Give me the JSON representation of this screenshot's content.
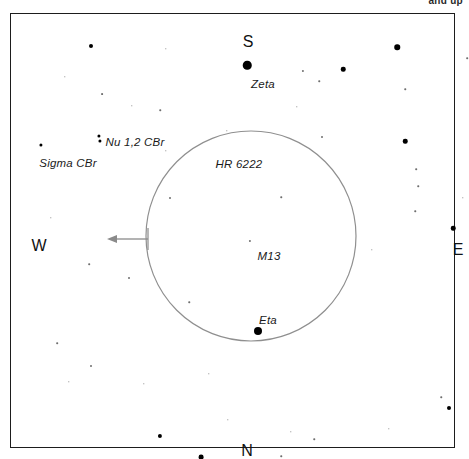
{
  "legend": {
    "caption": "and up"
  },
  "frame": {
    "name": "sky-chart-frame"
  },
  "directions": [
    {
      "id": "south",
      "label": "S",
      "x": 237,
      "y": 28
    },
    {
      "id": "west",
      "label": "W",
      "x": 28,
      "y": 232
    },
    {
      "id": "east",
      "label": "E",
      "x": 447,
      "y": 236
    },
    {
      "id": "north",
      "label": "N",
      "x": 236,
      "y": 437
    }
  ],
  "fov_circle": {
    "name": "telescope-field-of-view",
    "cx": 240,
    "cy": 222,
    "r": 105,
    "stroke": "#8f8f8f"
  },
  "direction_arrow": {
    "name": "drift-direction-arrow",
    "x1": 137,
    "y1": 225,
    "x2": 96,
    "y2": 225,
    "stroke": "#8a8a8a"
  },
  "object_labels": [
    {
      "id": "zeta",
      "text": "Zeta",
      "x": 252,
      "y": 70
    },
    {
      "id": "nu",
      "text": "Nu 1,2 CBr",
      "x": 124,
      "y": 128
    },
    {
      "id": "sigma",
      "text": "Sigma CBr",
      "x": 57,
      "y": 149
    },
    {
      "id": "hr6222",
      "text": "HR 6222",
      "x": 228,
      "y": 150
    },
    {
      "id": "m13",
      "text": "M13",
      "x": 258,
      "y": 242
    },
    {
      "id": "eta",
      "text": "Eta",
      "x": 257,
      "y": 306
    }
  ],
  "bright_stars": [
    {
      "id": "zeta-star",
      "x": 236,
      "y": 51,
      "d": 8.5
    },
    {
      "id": "eta-star",
      "x": 247,
      "y": 317,
      "d": 8.0
    },
    {
      "id": "star-ne",
      "x": 386,
      "y": 33,
      "d": 5.5
    },
    {
      "id": "star-ne2",
      "x": 332,
      "y": 55,
      "d": 4.5
    },
    {
      "id": "star-e",
      "x": 394,
      "y": 127,
      "d": 4.5
    },
    {
      "id": "star-se",
      "x": 442,
      "y": 214,
      "d": 4.5
    },
    {
      "id": "star-nw",
      "x": 80,
      "y": 32,
      "d": 4.0
    },
    {
      "id": "star-nu1",
      "x": 88,
      "y": 122,
      "d": 3.2
    },
    {
      "id": "star-nu2",
      "x": 89,
      "y": 127,
      "d": 3.2
    },
    {
      "id": "star-sigma",
      "x": 30,
      "y": 131,
      "d": 3.2
    },
    {
      "id": "star-s1",
      "x": 149,
      "y": 422,
      "d": 4.2
    },
    {
      "id": "star-s2",
      "x": 190,
      "y": 443,
      "d": 4.8
    },
    {
      "id": "star-se2",
      "x": 438,
      "y": 394,
      "d": 4.0
    }
  ],
  "faint_stars": [
    {
      "id": "f01",
      "x": 292,
      "y": 57,
      "d": 2.2
    },
    {
      "id": "f02",
      "x": 456,
      "y": 44,
      "d": 1.6
    },
    {
      "id": "f03",
      "x": 308,
      "y": 67,
      "d": 1.5
    },
    {
      "id": "f04",
      "x": 394,
      "y": 75,
      "d": 1.5
    },
    {
      "id": "f05",
      "x": 155,
      "y": 35,
      "d": 1.4
    },
    {
      "id": "f06",
      "x": 54,
      "y": 63,
      "d": 1.4
    },
    {
      "id": "f07",
      "x": 91,
      "y": 80,
      "d": 1.8
    },
    {
      "id": "f08",
      "x": 121,
      "y": 92,
      "d": 1.4
    },
    {
      "id": "f09",
      "x": 149,
      "y": 96,
      "d": 1.5
    },
    {
      "id": "f10",
      "x": 311,
      "y": 123,
      "d": 2.0
    },
    {
      "id": "f11",
      "x": 286,
      "y": 93,
      "d": 1.4
    },
    {
      "id": "f12",
      "x": 155,
      "y": 137,
      "d": 1.4
    },
    {
      "id": "f13",
      "x": 405,
      "y": 155,
      "d": 1.6
    },
    {
      "id": "f14",
      "x": 407,
      "y": 172,
      "d": 1.5
    },
    {
      "id": "f15",
      "x": 159,
      "y": 184,
      "d": 2.0
    },
    {
      "id": "f16",
      "x": 270,
      "y": 183,
      "d": 1.5
    },
    {
      "id": "f17",
      "x": 239,
      "y": 227,
      "d": 2.2
    },
    {
      "id": "f18",
      "x": 452,
      "y": 184,
      "d": 1.4
    },
    {
      "id": "f19",
      "x": 404,
      "y": 197,
      "d": 1.5
    },
    {
      "id": "f20",
      "x": 78,
      "y": 250,
      "d": 1.6
    },
    {
      "id": "f21",
      "x": 118,
      "y": 264,
      "d": 2.0
    },
    {
      "id": "f22",
      "x": 178,
      "y": 288,
      "d": 1.5
    },
    {
      "id": "f23",
      "x": 46,
      "y": 329,
      "d": 1.6
    },
    {
      "id": "f24",
      "x": 80,
      "y": 352,
      "d": 2.0
    },
    {
      "id": "f25",
      "x": 361,
      "y": 236,
      "d": 1.4
    },
    {
      "id": "f26",
      "x": 430,
      "y": 383,
      "d": 1.5
    },
    {
      "id": "f27",
      "x": 303,
      "y": 425,
      "d": 1.5
    },
    {
      "id": "f28",
      "x": 270,
      "y": 442,
      "d": 1.5
    },
    {
      "id": "f29",
      "x": 280,
      "y": 418,
      "d": 1.4
    },
    {
      "id": "f30",
      "x": 378,
      "y": 415,
      "d": 1.4
    },
    {
      "id": "f31",
      "x": 58,
      "y": 368,
      "d": 1.4
    },
    {
      "id": "f32",
      "x": 133,
      "y": 370,
      "d": 1.4
    },
    {
      "id": "f33",
      "x": 198,
      "y": 360,
      "d": 1.4
    },
    {
      "id": "f34",
      "x": 217,
      "y": 406,
      "d": 1.4
    },
    {
      "id": "f35",
      "x": 40,
      "y": 204,
      "d": 1.4
    },
    {
      "id": "f36",
      "x": 216,
      "y": 117,
      "d": 1.4
    }
  ]
}
